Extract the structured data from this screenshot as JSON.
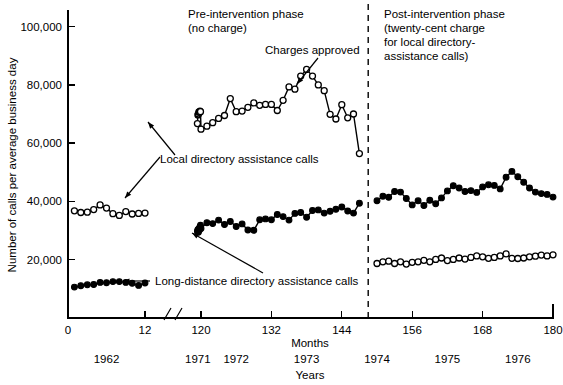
{
  "chart_data": {
    "type": "line",
    "title": "",
    "xlabel": "Months",
    "xlabel_secondary": "Years",
    "ylabel": "Number of calls per average business day",
    "ylim": [
      0,
      105000
    ],
    "yticks": [
      20000,
      40000,
      60000,
      80000,
      100000
    ],
    "ytick_labels": [
      "20,000",
      "40,000",
      "60,000",
      "80,000",
      "100,000"
    ],
    "xticks": [
      0,
      12,
      120,
      132,
      144,
      156,
      168,
      180
    ],
    "xtick_labels": [
      "0",
      "12",
      "120",
      "132",
      "144",
      "156",
      "168",
      "180"
    ],
    "axis_break": {
      "after": 12,
      "before": 120,
      "label": "axis-break"
    },
    "year_labels": [
      {
        "text": "1962",
        "month": 6
      },
      {
        "text": "1971",
        "month": 114
      },
      {
        "text": "1972",
        "month": 126
      },
      {
        "text": "1973",
        "month": 138
      },
      {
        "text": "1974",
        "month": 150
      },
      {
        "text": "1975",
        "month": 162
      },
      {
        "text": "1976",
        "month": 174
      }
    ],
    "grid": false,
    "legend_position": "inline-annotations",
    "intervention_month": 148.5,
    "annotations": [
      {
        "name": "pre-intervention-phase",
        "lines": [
          "Pre-intervention phase",
          "(no charge)"
        ]
      },
      {
        "name": "post-intervention-phase",
        "lines": [
          "Post-intervention phase",
          "(twenty-cent charge",
          "for local directory-",
          "assistance calls)"
        ]
      },
      {
        "name": "charges-approved",
        "lines": [
          "Charges approved"
        ]
      },
      {
        "name": "local-directory-assistance-calls",
        "lines": [
          "Local directory assistance calls"
        ]
      },
      {
        "name": "long-distance-directory-assistance-calls",
        "lines": [
          "Long-distance directory assistance calls"
        ]
      }
    ],
    "series": [
      {
        "name": "Local directory assistance calls",
        "marker": "open-circle",
        "segments": [
          {
            "name": "local-1962",
            "x": [
              1,
              2,
              3,
              4,
              5,
              6,
              7,
              8,
              9,
              10,
              11,
              12
            ],
            "values": [
              36800,
              36200,
              36300,
              37200,
              38800,
              37700,
              35800,
              35200,
              36500,
              35700,
              35900,
              36000
            ]
          },
          {
            "name": "local-1971-1973",
            "x": [
              113,
              114,
              115,
              116,
              117,
              118,
              119,
              120,
              121,
              122,
              123,
              124,
              125,
              126,
              127,
              128,
              129,
              130,
              131,
              132,
              133,
              134,
              135,
              136,
              137,
              138,
              139,
              140,
              141,
              142,
              143,
              144,
              145,
              146,
              147
            ],
            "values": [
              66700,
              69700,
              70000,
              70700,
              70600,
              71000,
              70800,
              64800,
              65800,
              67000,
              68500,
              69500,
              75300,
              70800,
              71000,
              72300,
              73800,
              73000,
              73300,
              73300,
              71200,
              74700,
              79300,
              78500,
              83000,
              85300,
              83000,
              80000,
              78000,
              69900,
              68300,
              73200,
              68700,
              70000,
              56400
            ]
          },
          {
            "name": "local-1974-1976",
            "x": [
              150,
              151,
              152,
              153,
              154,
              155,
              156,
              157,
              158,
              159,
              160,
              161,
              162,
              163,
              164,
              165,
              166,
              167,
              168,
              169,
              170,
              171,
              172,
              173,
              174,
              175,
              176,
              177,
              178,
              179,
              180
            ],
            "values": [
              18700,
              19300,
              19500,
              18700,
              19300,
              18500,
              19100,
              19300,
              19800,
              19300,
              20100,
              20600,
              19700,
              20100,
              20600,
              20200,
              20800,
              21300,
              21000,
              20500,
              20800,
              21300,
              22000,
              20500,
              20400,
              20600,
              21000,
              21200,
              21600,
              21300,
              21700
            ]
          }
        ]
      },
      {
        "name": "Long-distance directory assistance calls",
        "marker": "filled-circle",
        "segments": [
          {
            "name": "longdistance-1962",
            "x": [
              1,
              2,
              3,
              4,
              5,
              6,
              7,
              8,
              9,
              10,
              11,
              12
            ],
            "values": [
              10600,
              11100,
              11400,
              11500,
              12200,
              12100,
              12500,
              12500,
              12200,
              11900,
              11200,
              12000
            ]
          },
          {
            "name": "longdistance-1971-1973",
            "x": [
              113,
              114,
              115,
              116,
              117,
              118,
              119,
              120,
              121,
              122,
              123,
              124,
              125,
              126,
              127,
              128,
              129,
              130,
              131,
              132,
              133,
              134,
              135,
              136,
              137,
              138,
              139,
              140,
              141,
              142,
              143,
              144,
              145,
              146,
              147
            ],
            "values": [
              29800,
              30300,
              29400,
              30600,
              30200,
              31300,
              31800,
              30700,
              32700,
              32400,
              33600,
              32100,
              33100,
              31400,
              32300,
              30200,
              30100,
              33700,
              34000,
              33700,
              35500,
              34800,
              33600,
              35900,
              36200,
              34600,
              36900,
              37100,
              36000,
              36600,
              37300,
              38100,
              36700,
              36000,
              39400
            ]
          },
          {
            "name": "longdistance-1974-1976",
            "x": [
              150,
              151,
              152,
              153,
              154,
              155,
              156,
              157,
              158,
              159,
              160,
              161,
              162,
              163,
              164,
              165,
              166,
              167,
              168,
              169,
              170,
              171,
              172,
              173,
              174,
              175,
              176,
              177,
              178,
              179,
              180
            ],
            "values": [
              40200,
              41800,
              41400,
              43400,
              43200,
              41000,
              38800,
              40200,
              38600,
              40400,
              39200,
              41200,
              43600,
              45400,
              44600,
              43400,
              43700,
              43100,
              45000,
              45700,
              45500,
              44300,
              48300,
              50300,
              48500,
              46600,
              44600,
              43200,
              42700,
              42400,
              41500
            ]
          }
        ]
      }
    ]
  },
  "layout": {
    "plot_left": 68,
    "plot_right": 553,
    "plot_top": 12,
    "plot_bottom": 318
  }
}
